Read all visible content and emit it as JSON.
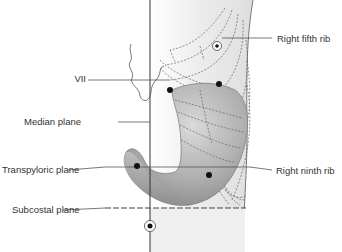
{
  "figure": {
    "labels": {
      "vii": "VII",
      "median_plane": "Median plane",
      "transpyloric_plane": "Transpyloric plane",
      "subcostal_plane": "Subcostal plane",
      "right_fifth_rib": "Right fifth rib",
      "right_ninth_rib": "Right ninth rib"
    },
    "colors": {
      "body_shading": "#e6e6e6",
      "stomach": "#a9a9a9",
      "stomach_highlight": "#d4d4d4",
      "lines": "#444444",
      "text": "#333333"
    }
  }
}
